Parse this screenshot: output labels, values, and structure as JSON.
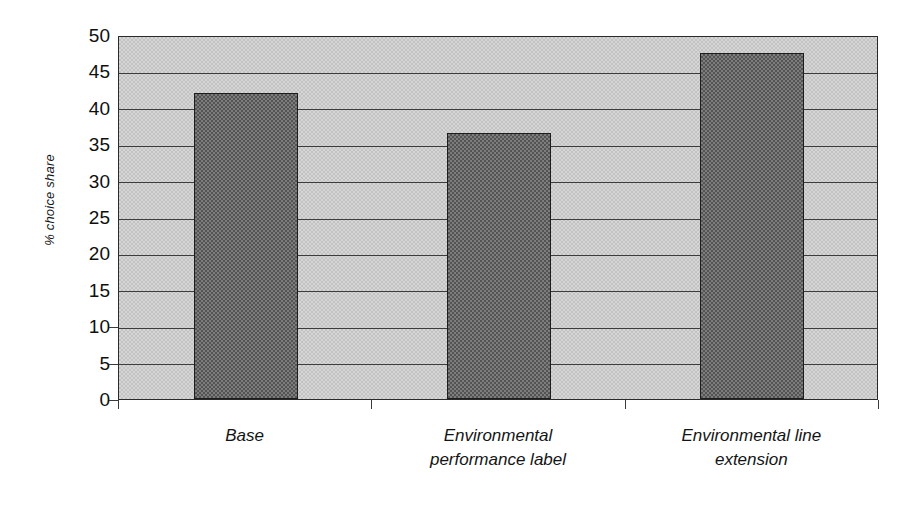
{
  "chart_data": {
    "type": "bar",
    "title": "",
    "subtitle": "",
    "xlabel": "",
    "ylabel": "% choice share",
    "categories": [
      "Base",
      "Environmental performance label",
      "Environmental line extension"
    ],
    "category_lines": [
      [
        "Base"
      ],
      [
        "Environmental",
        "performance label"
      ],
      [
        "Environmental line",
        "extension"
      ]
    ],
    "values": [
      42.0,
      36.5,
      47.5
    ],
    "series": [
      {
        "name": "% choice share",
        "values": [
          42.0,
          36.5,
          47.5
        ]
      }
    ],
    "ylim": [
      0,
      50
    ],
    "ytick_step": 5,
    "yticks": [
      0,
      5,
      10,
      15,
      20,
      25,
      30,
      35,
      40,
      45,
      50
    ],
    "ytick_labels": [
      "0",
      "5",
      "10",
      "15",
      "20",
      "25",
      "30",
      "35",
      "40",
      "45",
      "50"
    ],
    "xlim_categories": 3,
    "grid": true,
    "grid_axis": "y",
    "legend": false,
    "legend_position": "none",
    "annotations": [],
    "colors": {
      "bar_fill": "#7d7d7d",
      "bar_edge": "#1d1d1d",
      "plot_background": "#d6d6d6",
      "gridline": "#3c3c3c",
      "axis": "#2a2a2a",
      "text": "#141414",
      "figure_background": "#ffffff"
    }
  }
}
